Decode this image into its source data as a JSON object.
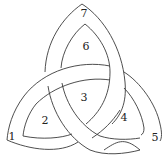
{
  "diagram": {
    "type": "triquetra",
    "stroke_color": "#3a3a3a",
    "background": "#ffffff",
    "regions": [
      {
        "id": "1",
        "label": "1",
        "x": 12,
        "y": 137
      },
      {
        "id": "2",
        "label": "2",
        "x": 45,
        "y": 121
      },
      {
        "id": "3",
        "label": "3",
        "x": 84,
        "y": 98
      },
      {
        "id": "4",
        "label": "4",
        "x": 124,
        "y": 118
      },
      {
        "id": "5",
        "label": "5",
        "x": 155,
        "y": 138
      },
      {
        "id": "6",
        "label": "6",
        "x": 86,
        "y": 47
      },
      {
        "id": "7",
        "label": "7",
        "x": 84,
        "y": 14
      }
    ]
  }
}
